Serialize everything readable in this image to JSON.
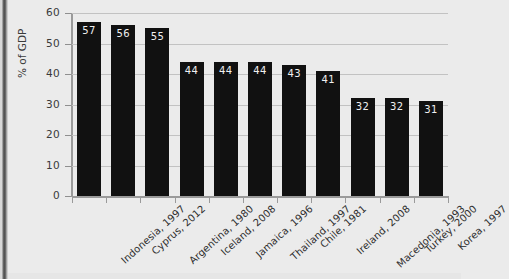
{
  "chart_data": {
    "type": "bar",
    "title": "",
    "xlabel": "",
    "ylabel": "% of GDP",
    "ylim": [
      0,
      60
    ],
    "yticks": [
      0,
      10,
      20,
      30,
      40,
      50,
      60
    ],
    "grid": true,
    "legend": "none",
    "bar_color": "#111111",
    "background_color": "#ebebeb",
    "gridline_color": "#c2c2c2",
    "value_label_color": "#f0f0f0",
    "categories": [
      "Indonesia, 1997",
      "Cyprus, 2012",
      "Argentina, 1980",
      "Iceland, 2008",
      "Jamaica, 1996",
      "Thailand, 1997",
      "Chile, 1981",
      "Ireland, 2008",
      "Macedonia, 1993",
      "Turkey, 2000",
      "Korea, 1997"
    ],
    "values": [
      57,
      56,
      55,
      44,
      44,
      44,
      43,
      41,
      32,
      32,
      31
    ]
  }
}
